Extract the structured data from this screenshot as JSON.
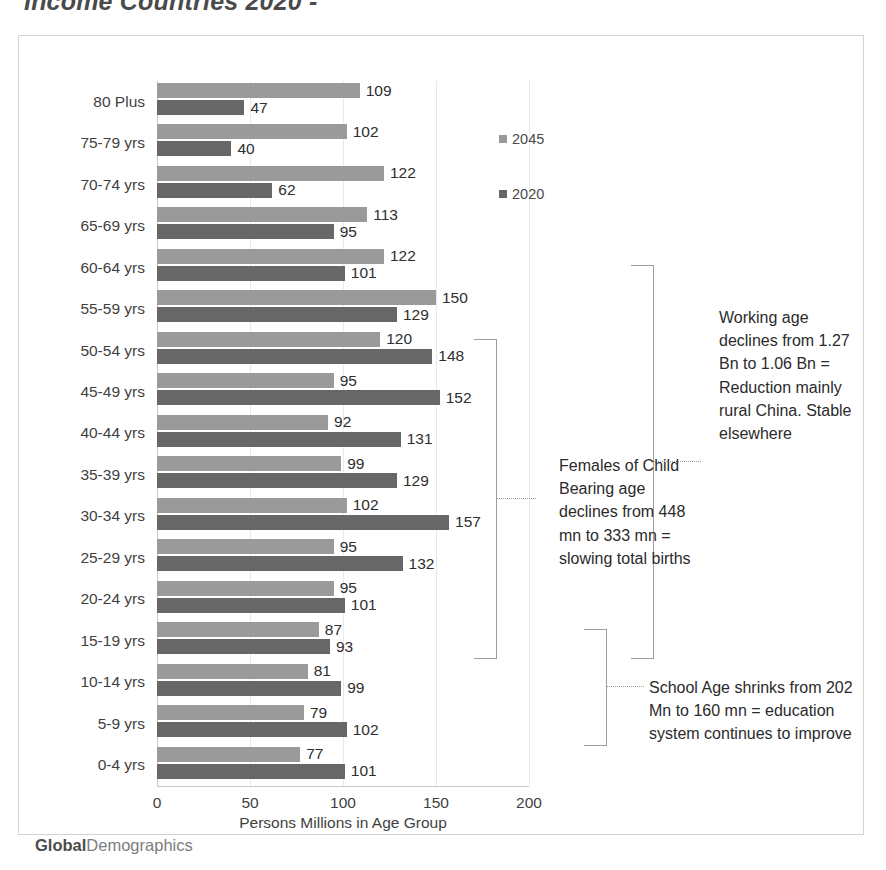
{
  "title": "Income Countries 2020 -",
  "watermark": {
    "bold": "Global",
    "rest": "Demographics"
  },
  "legend": {
    "position": "inside-top-right",
    "items": [
      {
        "label": "2045",
        "color": "#9a9a9a"
      },
      {
        "label": "2020",
        "color": "#676767"
      }
    ]
  },
  "annotations": {
    "working_age": "Working age declines from 1.27 Bn to 1.06 Bn = Reduction mainly rural China. Stable elsewhere",
    "females": "Females of Child Bearing age declines from 448 mn to 333 mn = slowing total births",
    "school": "School Age shrinks from 202 Mn to 160 mn = education system continues to improve"
  },
  "chart_data": {
    "type": "bar",
    "orientation": "horizontal",
    "title": "Income Countries 2020 -",
    "xlabel": "Persons Millions in Age Group",
    "ylabel": "",
    "xlim": [
      0,
      200
    ],
    "xticks": [
      0,
      50,
      100,
      150,
      200
    ],
    "grid": true,
    "legend_position": "inside-top-right",
    "categories": [
      "80 Plus",
      "75-79 yrs",
      "70-74 yrs",
      "65-69 yrs",
      "60-64 yrs",
      "55-59 yrs",
      "50-54 yrs",
      "45-49 yrs",
      "40-44 yrs",
      "35-39 yrs",
      "30-34 yrs",
      "25-29 yrs",
      "20-24 yrs",
      "15-19 yrs",
      "10-14 yrs",
      "5-9 yrs",
      "0-4 yrs"
    ],
    "series": [
      {
        "name": "2045",
        "color": "#9a9a9a",
        "values": [
          109,
          102,
          122,
          113,
          122,
          150,
          120,
          95,
          92,
          99,
          102,
          95,
          95,
          87,
          81,
          79,
          77
        ]
      },
      {
        "name": "2020",
        "color": "#676767",
        "values": [
          47,
          40,
          62,
          95,
          101,
          129,
          148,
          152,
          131,
          129,
          157,
          132,
          101,
          93,
          99,
          102,
          101
        ]
      }
    ]
  }
}
